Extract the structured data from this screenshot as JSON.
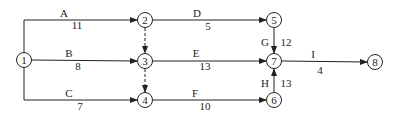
{
  "diagram": {
    "type": "activity-on-arrow network",
    "nodes": [
      {
        "id": "1",
        "x": 24,
        "y": 60
      },
      {
        "id": "2",
        "x": 145,
        "y": 20
      },
      {
        "id": "3",
        "x": 145,
        "y": 61
      },
      {
        "id": "4",
        "x": 145,
        "y": 100
      },
      {
        "id": "5",
        "x": 274,
        "y": 20
      },
      {
        "id": "6",
        "x": 274,
        "y": 100
      },
      {
        "id": "7",
        "x": 274,
        "y": 61
      },
      {
        "id": "8",
        "x": 375,
        "y": 62
      }
    ],
    "activities": [
      {
        "name": "A",
        "duration": "11",
        "from": "1",
        "to": "2"
      },
      {
        "name": "B",
        "duration": "8",
        "from": "1",
        "to": "3"
      },
      {
        "name": "C",
        "duration": "7",
        "from": "1",
        "to": "4"
      },
      {
        "name": "D",
        "duration": "5",
        "from": "2",
        "to": "5"
      },
      {
        "name": "E",
        "duration": "13",
        "from": "3",
        "to": "7"
      },
      {
        "name": "F",
        "duration": "10",
        "from": "4",
        "to": "6"
      },
      {
        "name": "G",
        "duration": "12",
        "from": "5",
        "to": "7"
      },
      {
        "name": "H",
        "duration": "13",
        "from": "6",
        "to": "7"
      },
      {
        "name": "I",
        "duration": "4",
        "from": "7",
        "to": "8"
      }
    ],
    "dummies": [
      {
        "from": "2",
        "to": "3"
      },
      {
        "from": "3",
        "to": "4"
      }
    ]
  }
}
